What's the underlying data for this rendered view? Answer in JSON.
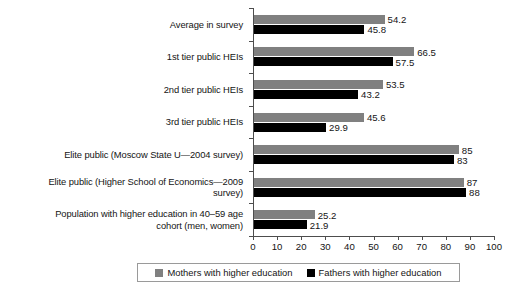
{
  "chart_data": {
    "type": "bar",
    "orientation": "horizontal",
    "title": "",
    "xlabel": "",
    "ylabel": "",
    "xlim": [
      0,
      100
    ],
    "xticks": [
      0,
      10,
      20,
      30,
      40,
      50,
      60,
      70,
      80,
      90,
      100
    ],
    "grid": false,
    "legend_position": "bottom",
    "categories": [
      "Average in survey",
      "1st tier public HEIs",
      "2nd tier public HEIs",
      "3rd tier public HEIs",
      "Elite public (Moscow State U—2004 survey)",
      "Elite public (Higher School of Economics—2009 survey)",
      "Population with higher education in 40–59 age cohort (men, women)"
    ],
    "category_lines": [
      [
        "Average in survey"
      ],
      [
        "1st tier public HEIs"
      ],
      [
        "2nd tier public HEIs"
      ],
      [
        "3rd tier public HEIs"
      ],
      [
        "Elite public (Moscow State U—2004 survey)"
      ],
      [
        "Elite public (Higher School of Economics—2009",
        "survey)"
      ],
      [
        "Population with higher education in 40–59 age",
        "cohort (men, women)"
      ]
    ],
    "series": [
      {
        "name": "Mothers with higher education",
        "color": "#808080",
        "values": [
          54.2,
          66.5,
          53.5,
          45.6,
          85,
          87,
          25.2
        ],
        "labels": [
          "54.2",
          "66.5",
          "53.5",
          "45.6",
          "85",
          "87",
          "25.2"
        ]
      },
      {
        "name": "Fathers with higher education",
        "color": "#000000",
        "values": [
          45.8,
          57.5,
          43.2,
          29.9,
          83,
          88,
          21.9
        ],
        "labels": [
          "45.8",
          "57.5",
          "43.2",
          "29.9",
          "83",
          "88",
          "21.9"
        ]
      }
    ]
  },
  "legend": {
    "entries": [
      {
        "label": "Mothers with higher education",
        "color": "#808080",
        "swatch": "gray-square-icon"
      },
      {
        "label": "Fathers with higher education",
        "color": "#000000",
        "swatch": "black-square-icon"
      }
    ]
  },
  "axis": {
    "x_tick_labels": [
      "0",
      "10",
      "20",
      "30",
      "40",
      "50",
      "60",
      "70",
      "80",
      "90",
      "100"
    ]
  }
}
